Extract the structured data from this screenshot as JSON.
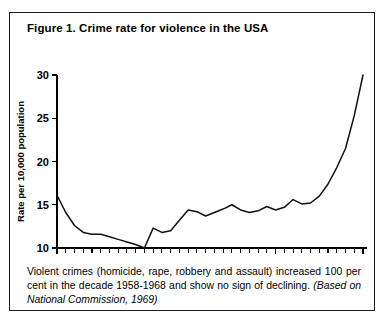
{
  "figure": {
    "title": "Figure 1. Crime rate for violence in the USA",
    "caption_main": "Violent crimes (homicide, rape, robbery and assault) increased 100 per cent in the decade 1958-1968 and show no sign of declining.",
    "caption_source": "(Based on National Commission, 1969)"
  },
  "chart_data": {
    "type": "line",
    "title": "Crime rate for violence in the USA",
    "xlabel": "",
    "ylabel": "Rate per 10,000 population",
    "xlim": [
      1933,
      1968
    ],
    "ylim": [
      10,
      30
    ],
    "yticks": [
      10,
      15,
      20,
      25,
      30
    ],
    "ytick_labels": [
      "10",
      "15",
      "20",
      "25",
      "30"
    ],
    "xticks": [
      1933,
      1958,
      1968
    ],
    "xtick_labels": [
      "1933",
      "1958",
      "1968"
    ],
    "x_minor_tick_interval": 1,
    "grid": false,
    "legend": false,
    "series": [
      {
        "name": "Violent crime rate",
        "x": [
          1933,
          1934,
          1935,
          1936,
          1937,
          1938,
          1939,
          1940,
          1941,
          1942,
          1943,
          1944,
          1945,
          1946,
          1947,
          1948,
          1949,
          1950,
          1951,
          1952,
          1953,
          1954,
          1955,
          1956,
          1957,
          1958,
          1959,
          1960,
          1961,
          1962,
          1963,
          1964,
          1965,
          1966,
          1967,
          1968
        ],
        "values": [
          16.1,
          14.1,
          12.6,
          11.8,
          11.6,
          11.6,
          11.3,
          11.0,
          10.7,
          10.4,
          10.0,
          12.3,
          11.8,
          12.0,
          13.2,
          14.4,
          14.2,
          13.7,
          14.1,
          14.5,
          15.0,
          14.4,
          14.1,
          14.3,
          14.8,
          14.4,
          14.7,
          15.6,
          15.1,
          15.2,
          16.0,
          17.4,
          19.3,
          21.5,
          25.3,
          30.0
        ]
      }
    ]
  }
}
